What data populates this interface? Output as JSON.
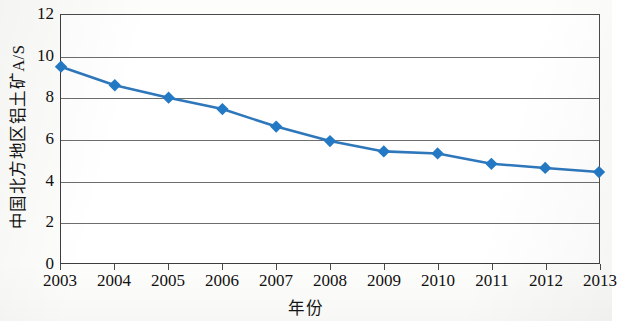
{
  "chart_data": {
    "type": "line",
    "title": "",
    "xlabel": "年份",
    "ylabel": "中国北方地区铝土矿A/S",
    "x": [
      2003,
      2004,
      2005,
      2006,
      2007,
      2008,
      2009,
      2010,
      2011,
      2012,
      2013
    ],
    "categories": [
      "2003",
      "2004",
      "2005",
      "2006",
      "2007",
      "2008",
      "2009",
      "2010",
      "2011",
      "2012",
      "2013"
    ],
    "values": [
      9.5,
      8.6,
      8.0,
      7.45,
      6.6,
      5.9,
      5.4,
      5.3,
      4.8,
      4.6,
      4.4
    ],
    "series": [
      {
        "name": "中国北方地区铝土矿A/S",
        "values": [
          9.5,
          8.6,
          8.0,
          7.45,
          6.6,
          5.9,
          5.4,
          5.3,
          4.8,
          4.6,
          4.4
        ]
      }
    ],
    "ylim": [
      0,
      12
    ],
    "xlim": [
      2003,
      2013
    ],
    "y_ticks": [
      0,
      2,
      4,
      6,
      8,
      10,
      12
    ],
    "y_tick_labels": [
      "0",
      "2",
      "4",
      "6",
      "8",
      "10",
      "12"
    ],
    "grid": "horizontal",
    "legend": "none",
    "marker": "diamond",
    "line_color": "#2e77bb",
    "marker_color": "#2479c4",
    "axis_color": "#3d3d3d",
    "grid_color": "#6d6d6d"
  },
  "axes": {
    "y_title": "中国北方地区铝土矿A/S",
    "x_title": "年份"
  }
}
